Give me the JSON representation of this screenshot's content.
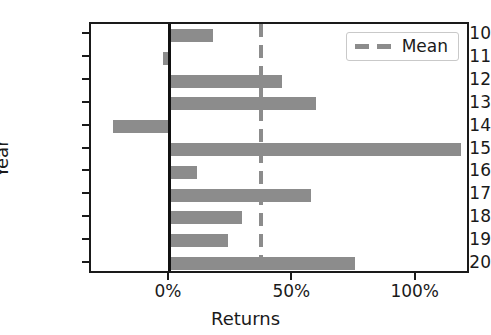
{
  "chart_data": {
    "type": "bar",
    "orientation": "horizontal",
    "title": "",
    "xlabel": "Returns",
    "ylabel": "Year",
    "categories": [
      "2010",
      "2011",
      "2012",
      "2013",
      "2014",
      "2015",
      "2016",
      "2017",
      "2018",
      "2019",
      "2020"
    ],
    "values": [
      17.5,
      -3.0,
      45.5,
      59.0,
      -23.0,
      118.0,
      11.0,
      57.0,
      29.0,
      23.5,
      75.0
    ],
    "value_unit": "%",
    "xlim": [
      -32,
      122
    ],
    "xticks": [
      0,
      50,
      100
    ],
    "xtick_labels": [
      "0%",
      "50%",
      "100%"
    ],
    "grid": false,
    "bar_color": "#8c8c8c",
    "zero_line_color": "#111111",
    "annotations": [
      {
        "name": "mean-line",
        "type": "vline",
        "value": 37.0,
        "style": "dashed",
        "color": "#8c8c8c",
        "label": "Mean"
      }
    ],
    "legend": {
      "position": "upper right",
      "entries": [
        {
          "label": "Mean",
          "color": "#8c8c8c",
          "style": "dashed"
        }
      ]
    }
  },
  "axes": {
    "ylabel": "Year",
    "xlabel": "Returns"
  },
  "legend": {
    "mean_label": "Mean"
  }
}
